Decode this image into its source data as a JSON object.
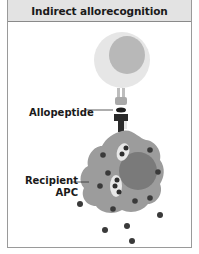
{
  "title": "Indirect allorecognition",
  "labels": {
    "allopeptide": "Allopeptide",
    "recipient_apc_line1": "Recipient",
    "recipient_apc_line2": "APC"
  },
  "colors": {
    "header_bg": "#e3e3e3",
    "border": "#9a9a9a",
    "tcell_outer": "#e6e6e6",
    "tcell_nucleus": "#b8b8b8",
    "apc_body": "#9c9c9c",
    "apc_nucleus": "#7a7a7a",
    "dots": "#3a3a3a",
    "vesicle": "#e8e8e8"
  },
  "elements": [
    "T cell",
    "TCR",
    "MHC",
    "Allopeptide",
    "Recipient APC",
    "Endocytic vesicles",
    "Donor antigens"
  ]
}
